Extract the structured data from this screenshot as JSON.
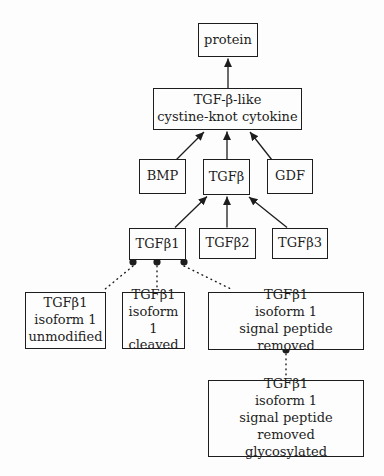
{
  "diagram": {
    "background_color": "#fdfdfd",
    "line_color": "#1d1d1d",
    "nodes": {
      "protein": {
        "label": "protein"
      },
      "cytokine": {
        "label": "TGF-β-like\ncystine-knot cytokine"
      },
      "bmp": {
        "label": "BMP"
      },
      "tgfb": {
        "label": "TGFβ"
      },
      "gdf": {
        "label": "GDF"
      },
      "tgfb1": {
        "label": "TGFβ1"
      },
      "tgfb2": {
        "label": "TGFβ2"
      },
      "tgfb3": {
        "label": "TGFβ3"
      },
      "iso1_unmodified": {
        "label": "TGFβ1\nisoform 1\nunmodified"
      },
      "iso1_cleaved": {
        "label": "TGFβ1\nisoform 1\ncleaved"
      },
      "iso1_spr": {
        "label": "TGFβ1\nisoform 1\nsignal peptide removed"
      },
      "iso1_spr_glyc": {
        "label": "TGFβ1\nisoform 1\nsignal peptide removed\nglycosylated"
      }
    },
    "edges": {
      "solid_arrows": [
        {
          "from": "TGF-β-like cystine-knot cytokine",
          "to": "protein"
        },
        {
          "from": "BMP",
          "to": "TGF-β-like cystine-knot cytokine"
        },
        {
          "from": "TGFβ",
          "to": "TGF-β-like cystine-knot cytokine"
        },
        {
          "from": "GDF",
          "to": "TGF-β-like cystine-knot cytokine"
        },
        {
          "from": "TGFβ1",
          "to": "TGFβ"
        },
        {
          "from": "TGFβ2",
          "to": "TGFβ"
        },
        {
          "from": "TGFβ3",
          "to": "TGFβ"
        }
      ],
      "dotted_links": [
        {
          "from": "TGFβ1",
          "to": "TGFβ1 isoform 1 unmodified"
        },
        {
          "from": "TGFβ1",
          "to": "TGFβ1 isoform 1 cleaved"
        },
        {
          "from": "TGFβ1",
          "to": "TGFβ1 isoform 1 signal peptide removed"
        },
        {
          "from": "TGFβ1 isoform 1 signal peptide removed",
          "to": "TGFβ1 isoform 1 signal peptide removed glycosylated"
        }
      ]
    }
  }
}
